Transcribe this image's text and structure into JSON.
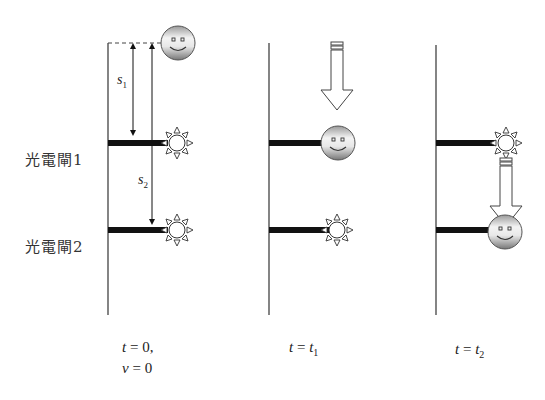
{
  "gates": [
    {
      "label": "光電閘1"
    },
    {
      "label": "光電閘2"
    }
  ],
  "distances": {
    "s1": {
      "base": "s",
      "sub": "1"
    },
    "s2": {
      "base": "s",
      "sub": "2"
    }
  },
  "panels": [
    {
      "time_label": {
        "var": "t",
        "eq": " = 0,",
        "sub": ""
      },
      "extra_label": {
        "var": "v",
        "eq": " = 0"
      },
      "ball_position": "top"
    },
    {
      "time_label": {
        "var": "t",
        "eq": " = ",
        "var2": "t",
        "sub": "1"
      },
      "ball_position": "gate1"
    },
    {
      "time_label": {
        "var": "t",
        "eq": " = ",
        "var2": "t",
        "sub": "2"
      },
      "ball_position": "gate2"
    }
  ],
  "colors": {
    "line": "#333333",
    "bar": "#111111",
    "ball_light": "#f2f2f2",
    "ball_dark": "#8a8a8a"
  }
}
